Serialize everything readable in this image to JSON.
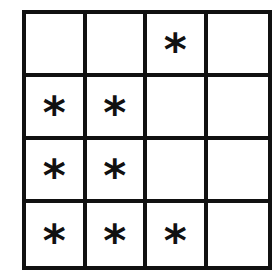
{
  "grid": {
    "rows": 4,
    "cols": 4,
    "mark_symbol": "*",
    "cells": [
      [
        "",
        "",
        "*",
        ""
      ],
      [
        "*",
        "*",
        "",
        ""
      ],
      [
        "*",
        "*",
        "",
        ""
      ],
      [
        "*",
        "*",
        "*",
        ""
      ]
    ]
  },
  "colors": {
    "line": "#111111",
    "background": "#ffffff"
  }
}
